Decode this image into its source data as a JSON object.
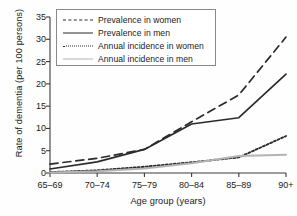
{
  "chart_data": {
    "type": "line",
    "title": "",
    "xlabel": "Age group (years)",
    "ylabel": "Rate of dementia (per 100 persons)",
    "categories": [
      "65–69",
      "70–74",
      "75–79",
      "80–84",
      "85–89",
      "90+"
    ],
    "ylim": [
      0,
      35
    ],
    "yticks": [
      0,
      5,
      10,
      15,
      20,
      25,
      30,
      35
    ],
    "ytick_labels": [
      "0",
      "5",
      "10",
      "15",
      "20",
      "25",
      "30",
      "35"
    ],
    "grid": false,
    "legend_position": "upper left",
    "series": [
      {
        "name": "Prevalence in women",
        "style": "dashed",
        "color": "#2b2b2b",
        "values": [
          2.0,
          3.3,
          5.3,
          11.5,
          17.5,
          30.5
        ]
      },
      {
        "name": "Prevalence in men",
        "style": "solid",
        "color": "#2b2b2b",
        "values": [
          0.9,
          2.5,
          5.3,
          11.0,
          12.4,
          22.2
        ]
      },
      {
        "name": "Annual incidence in women",
        "style": "dotted",
        "color": "#2b2b2b",
        "values": [
          0.2,
          0.6,
          1.4,
          2.4,
          3.5,
          8.3
        ]
      },
      {
        "name": "Annual incidence in men",
        "style": "solid-light",
        "color": "#b3b3b3",
        "values": [
          0.1,
          0.4,
          1.0,
          2.2,
          3.8,
          4.1
        ]
      }
    ]
  },
  "legend": {
    "items": [
      {
        "label": "Prevalence in women"
      },
      {
        "label": "Prevalence in men"
      },
      {
        "label": "Annual incidence in women"
      },
      {
        "label": "Annual incidence in men"
      }
    ]
  },
  "axes": {
    "y_label": "Rate of dementia (per 100 persons)",
    "x_label": "Age group (years)"
  }
}
